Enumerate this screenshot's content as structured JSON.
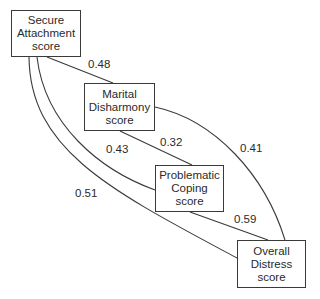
{
  "diagram": {
    "type": "path-diagram",
    "nodes": [
      {
        "id": "secure",
        "lines": [
          "Secure",
          "Attachment",
          "score"
        ]
      },
      {
        "id": "marital",
        "lines": [
          "Marital",
          "Disharmony",
          "score"
        ]
      },
      {
        "id": "coping",
        "lines": [
          "Problematic",
          "Coping",
          "score"
        ]
      },
      {
        "id": "distress",
        "lines": [
          "Overall",
          "Distress",
          "score"
        ]
      }
    ],
    "edges": [
      {
        "from": "secure",
        "to": "marital",
        "label": "0.48"
      },
      {
        "from": "marital",
        "to": "coping",
        "label": "0.32"
      },
      {
        "from": "marital",
        "to": "distress",
        "label": "0.41"
      },
      {
        "from": "secure",
        "to": "coping",
        "label": "0.43"
      },
      {
        "from": "coping",
        "to": "distress",
        "label": "0.59"
      },
      {
        "from": "secure",
        "to": "distress",
        "label": "0.51"
      }
    ],
    "line_color": "#3a3a3a"
  }
}
